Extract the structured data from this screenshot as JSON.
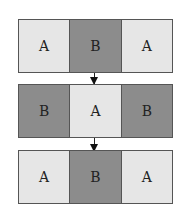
{
  "diagram": {
    "rows": [
      {
        "cells": [
          {
            "label": "A",
            "shade": "light"
          },
          {
            "label": "B",
            "shade": "dark"
          },
          {
            "label": "A",
            "shade": "light"
          }
        ]
      },
      {
        "cells": [
          {
            "label": "B",
            "shade": "dark"
          },
          {
            "label": "A",
            "shade": "light"
          },
          {
            "label": "B",
            "shade": "dark"
          }
        ]
      },
      {
        "cells": [
          {
            "label": "A",
            "shade": "light"
          },
          {
            "label": "B",
            "shade": "dark"
          },
          {
            "label": "A",
            "shade": "light"
          }
        ]
      }
    ],
    "colors": {
      "light": "#e6e6e6",
      "dark": "#8c8c8c",
      "border": "#555555",
      "arrow": "#111111"
    }
  }
}
